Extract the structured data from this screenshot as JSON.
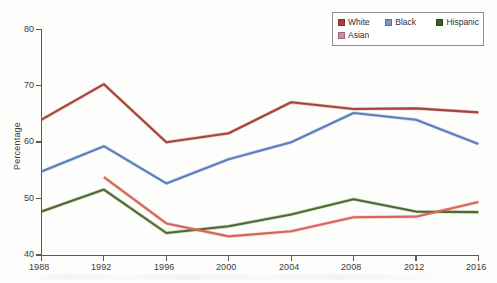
{
  "chart_data": {
    "type": "line",
    "title": "",
    "xlabel": "",
    "ylabel": "Percentage",
    "x": [
      1988,
      1992,
      1996,
      2000,
      2004,
      2008,
      2012,
      2016
    ],
    "xticklabels": [
      "1988",
      "1992",
      "1996",
      "2000",
      "2004",
      "2008",
      "2012",
      "2016"
    ],
    "yticks": [
      40,
      50,
      60,
      70,
      80
    ],
    "yticklabels": [
      "40",
      "50",
      "60",
      "70",
      "80"
    ],
    "ylim": [
      40,
      80
    ],
    "xlim": [
      1988,
      2016
    ],
    "grid": false,
    "legend_position": "top-right",
    "series": [
      {
        "name": "White",
        "color": "#a8423b",
        "x": [
          1988,
          1992,
          1996,
          2000,
          2004,
          2008,
          2012,
          2016
        ],
        "values": [
          64.0,
          70.3,
          60.0,
          61.6,
          67.1,
          65.9,
          66.0,
          65.3
        ]
      },
      {
        "name": "Black",
        "color": "#5b7fc0",
        "x": [
          1988,
          1992,
          1996,
          2000,
          2004,
          2008,
          2012,
          2016
        ],
        "values": [
          54.8,
          59.3,
          52.7,
          57.0,
          60.0,
          65.2,
          64.0,
          59.7
        ]
      },
      {
        "name": "Hispanic",
        "color": "#4e6b2f",
        "x": [
          1988,
          1992,
          1996,
          2000,
          2004,
          2008,
          2012,
          2016
        ],
        "values": [
          47.7,
          51.6,
          43.9,
          45.1,
          47.2,
          49.9,
          47.7,
          47.6
        ]
      },
      {
        "name": "Asian",
        "color": "#d9655a",
        "x": [
          1992,
          1996,
          2000,
          2004,
          2008,
          2012,
          2016
        ],
        "values": [
          53.8,
          45.6,
          43.3,
          44.2,
          46.7,
          46.8,
          49.4
        ]
      }
    ]
  },
  "axes": {
    "y_axis_label": "Percentage",
    "y_tick_labels": [
      "80",
      "70",
      "60",
      "50",
      "40"
    ],
    "x_tick_labels": [
      "1988",
      "1992",
      "1996",
      "2000",
      "2004",
      "2008",
      "2012",
      "2016"
    ]
  },
  "legend": {
    "row1": [
      {
        "label": "White",
        "color": "#a8423b"
      },
      {
        "label": "Black",
        "color": "#5b7fc0"
      },
      {
        "label": "Hispanic",
        "color": "#3f5a2a"
      }
    ],
    "row2": [
      {
        "label": "Asian",
        "color": "#d08aa8"
      }
    ]
  }
}
